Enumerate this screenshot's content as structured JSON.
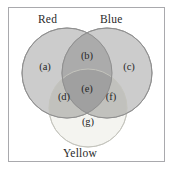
{
  "figure": {
    "type": "venn-diagram-three-set",
    "width": 175,
    "height": 172,
    "frame_color": "#a9a9ad",
    "background": "#ffffff"
  },
  "sets": [
    {
      "id": "red",
      "label": "Red",
      "fill": "#c9c9c9",
      "stroke": "#9a9a9a",
      "cx": 67,
      "cy": 73,
      "r": 45
    },
    {
      "id": "blue",
      "label": "Blue",
      "fill": "#c9c9c9",
      "stroke": "#9a9a9a",
      "cx": 107,
      "cy": 73,
      "r": 45
    },
    {
      "id": "yellow",
      "label": "Yellow",
      "fill": "#f4f4f0",
      "stroke": "#cfcfc8",
      "cx": 88,
      "cy": 108,
      "r": 39
    }
  ],
  "regions": [
    {
      "id": "a",
      "label": "(a)",
      "meaning": "Red only",
      "x": 45,
      "y": 66
    },
    {
      "id": "b",
      "label": "(b)",
      "meaning": "Red and Blue only",
      "x": 87,
      "y": 55
    },
    {
      "id": "c",
      "label": "(c)",
      "meaning": "Blue only",
      "x": 129,
      "y": 66
    },
    {
      "id": "d",
      "label": "(d)",
      "meaning": "Red and Yellow only",
      "x": 64,
      "y": 96
    },
    {
      "id": "e",
      "label": "(e)",
      "meaning": "Red, Blue and Yellow",
      "x": 87,
      "y": 88
    },
    {
      "id": "f",
      "label": "(f)",
      "meaning": "Blue and Yellow only",
      "x": 111,
      "y": 96
    },
    {
      "id": "g",
      "label": "(g)",
      "meaning": "Yellow only",
      "x": 88,
      "y": 121
    }
  ],
  "colors": {
    "circle_fill_primary": "#c9c9c9",
    "circle_fill_pale": "#f4f4f0",
    "overlap_two": "#b0b0b0",
    "overlap_three": "#a8a8a8",
    "text": "#272727",
    "frame": "#a9a9ad"
  }
}
